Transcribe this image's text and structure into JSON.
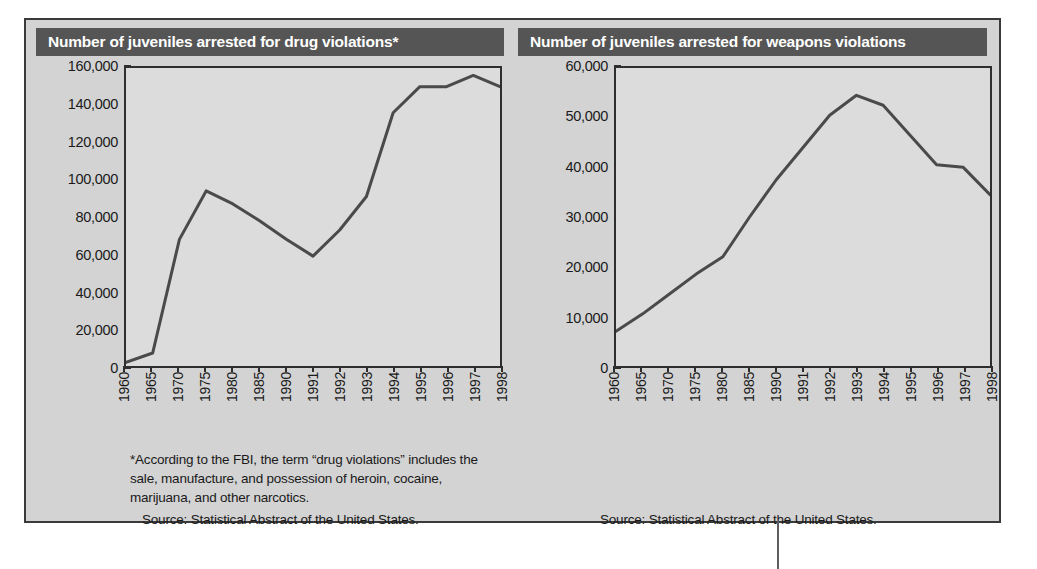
{
  "figure": {
    "background_color": "#d3d3d3",
    "border_color": "#3a3a3a",
    "title_bar_color": "#555555",
    "line_color": "#4a4a4a"
  },
  "charts": [
    {
      "id": "drug-violations",
      "title": "Number of juveniles arrested for drug violations*",
      "footnote": "*According to the FBI, the term “drug violations” includes the sale, manufacture, and possession of heroin, cocaine, marijuana, and other narcotics.",
      "source": "Source: Statistical Abstract of the United States."
    },
    {
      "id": "weapons-violations",
      "title": "Number of juveniles arrested for weapons violations",
      "footnote": "",
      "source": "Source: Statistical Abstract of the United States."
    }
  ],
  "chart_data": [
    {
      "type": "line",
      "title": "Number of juveniles arrested for drug violations*",
      "xlabel": "",
      "ylabel": "",
      "categories": [
        "1960",
        "1965",
        "1970",
        "1975",
        "1980",
        "1985",
        "1990",
        "1991",
        "1992",
        "1993",
        "1994",
        "1995",
        "1996",
        "1997",
        "1998"
      ],
      "values": [
        2000,
        7000,
        68000,
        94000,
        87000,
        78000,
        68000,
        59000,
        73000,
        91000,
        136000,
        150000,
        150000,
        156000,
        150000
      ],
      "ylim": [
        0,
        160000
      ],
      "yticks": [
        0,
        20000,
        40000,
        60000,
        80000,
        100000,
        120000,
        140000,
        160000
      ],
      "ytick_labels": [
        "0",
        "20,000",
        "40,000",
        "60,000",
        "80,000",
        "100,000",
        "120,000",
        "140,000",
        "160,000"
      ],
      "grid": false,
      "legend": false,
      "series_name": "Juveniles arrested for drug violations"
    },
    {
      "type": "line",
      "title": "Number of juveniles arrested for weapons violations",
      "xlabel": "",
      "ylabel": "",
      "categories": [
        "1960",
        "1965",
        "1970",
        "1975",
        "1980",
        "1985",
        "1990",
        "1991",
        "1992",
        "1993",
        "1994",
        "1995",
        "1996",
        "1997",
        "1998"
      ],
      "values": [
        7000,
        10500,
        14500,
        18500,
        22000,
        30000,
        37500,
        44000,
        50500,
        54500,
        52500,
        46500,
        40500,
        40000,
        34500
      ],
      "ylim": [
        0,
        60000
      ],
      "yticks": [
        0,
        10000,
        20000,
        30000,
        40000,
        50000,
        60000
      ],
      "ytick_labels": [
        "0",
        "10,000",
        "20,000",
        "30,000",
        "40,000",
        "50,000",
        "60,000"
      ],
      "grid": false,
      "legend": false,
      "series_name": "Juveniles arrested for weapons violations"
    }
  ]
}
